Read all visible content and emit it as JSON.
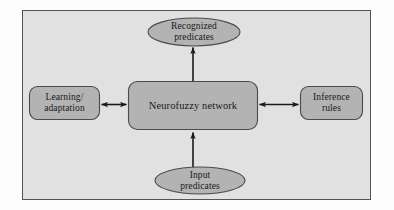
{
  "figure": {
    "panel": {
      "background_color": "#e1e1e1",
      "border_color": "#55544f"
    },
    "page_background_color": "#fdfdfd"
  },
  "style": {
    "shape_fill": "#b3b3b3",
    "shape_stroke": "#4a4a4a",
    "arrow_color": "#1a1a1a",
    "text_color": "#18181a"
  },
  "nodes": {
    "center": {
      "id": "neurofuzzy-network",
      "label": "Neurofuzzy network",
      "shape": "rounded-rectangle",
      "x": 128,
      "y": 81,
      "width": 130,
      "height": 49
    },
    "left": {
      "id": "learning-adaptation",
      "label": "Learning/\nadaptation",
      "shape": "rounded-rectangle",
      "x": 29,
      "y": 86,
      "width": 71,
      "height": 34
    },
    "right": {
      "id": "inference-rules",
      "label": "Inference\nrules",
      "shape": "rounded-rectangle",
      "x": 300,
      "y": 86,
      "width": 63,
      "height": 34
    },
    "top": {
      "id": "recognized-predicates",
      "label": "Recognized\npredicates",
      "shape": "ellipse",
      "x": 148,
      "y": 18,
      "width": 92,
      "height": 28
    },
    "bottom": {
      "id": "input-predicates",
      "label": "Input\npredicates",
      "shape": "ellipse",
      "x": 155,
      "y": 167,
      "width": 90,
      "height": 27
    }
  },
  "connectors": [
    {
      "id": "left-center-connector",
      "from": "learning-adaptation",
      "to": "neurofuzzy-network",
      "direction": "bidirectional",
      "orientation": "horizontal"
    },
    {
      "id": "center-right-connector",
      "from": "neurofuzzy-network",
      "to": "inference-rules",
      "direction": "bidirectional",
      "orientation": "horizontal"
    },
    {
      "id": "center-top-connector",
      "from": "neurofuzzy-network",
      "to": "recognized-predicates",
      "direction": "up",
      "orientation": "vertical"
    },
    {
      "id": "bottom-center-connector",
      "from": "input-predicates",
      "to": "neurofuzzy-network",
      "direction": "up",
      "orientation": "vertical"
    }
  ]
}
